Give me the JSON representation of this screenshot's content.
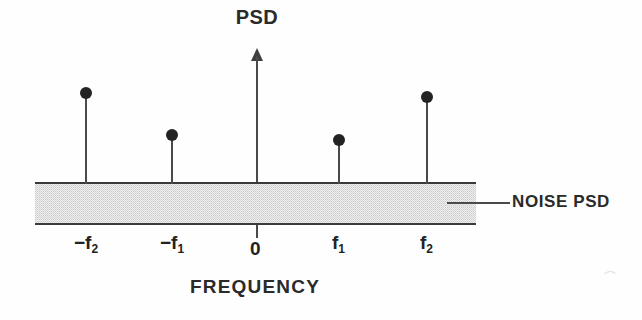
{
  "figure": {
    "y_axis_title": "PSD",
    "x_axis_title": "FREQUENCY",
    "noise_label": "NOISE PSD",
    "zero_label": "0",
    "scan_artifact": "⌒"
  },
  "ticks": [
    {
      "id": "neg-f2",
      "prefix": "−f",
      "sub": "2",
      "x": 74,
      "y": 232
    },
    {
      "id": "neg-f1",
      "prefix": "−f",
      "sub": "1",
      "x": 160,
      "y": 232
    },
    {
      "id": "zero",
      "prefix": "0",
      "sub": "",
      "x": 250,
      "y": 238
    },
    {
      "id": "pos-f1",
      "prefix": "f",
      "sub": "1",
      "x": 332,
      "y": 232
    },
    {
      "id": "pos-f2",
      "prefix": "f",
      "sub": "2",
      "x": 420,
      "y": 232
    }
  ],
  "chart_data": {
    "type": "line",
    "title": "PSD",
    "xlabel": "FREQUENCY",
    "ylabel": "PSD",
    "grid": false,
    "legend": "none",
    "annotations": [
      {
        "text": "NOISE PSD",
        "target": "noise floor band",
        "x": 512,
        "y": 202
      }
    ],
    "xticks": [
      "−f2",
      "−f1",
      "0",
      "f1",
      "f2"
    ],
    "noise_floor": {
      "label": "NOISE PSD",
      "type": "band",
      "x_start_px": 35,
      "x_end_px": 476,
      "top_px": 182,
      "bottom_px": 224,
      "fill": "#f0f0f0",
      "edge_color": "#3a3a3a"
    },
    "series": [
      {
        "name": "spectral lines",
        "type": "stem",
        "categories": [
          "−f2",
          "−f1",
          "f1",
          "f2"
        ],
        "values": [
          1.0,
          0.55,
          0.49,
          0.94
        ],
        "stems": [
          {
            "label": "−f2",
            "x_px": 86,
            "dot_y_px": 93,
            "height_px": 90
          },
          {
            "label": "−f1",
            "x_px": 172,
            "dot_y_px": 135,
            "height_px": 48
          },
          {
            "label": "f1",
            "x_px": 339,
            "dot_y_px": 140,
            "height_px": 43
          },
          {
            "label": "f2",
            "x_px": 427,
            "dot_y_px": 97,
            "height_px": 86
          }
        ]
      }
    ]
  },
  "colors": {
    "ink": "#2a2a2a",
    "line": "#4a4a4a",
    "dot": "#232323",
    "band_fill": "#f0f0f0",
    "band_edge": "#3a3a3a",
    "background": "#fefefe"
  }
}
